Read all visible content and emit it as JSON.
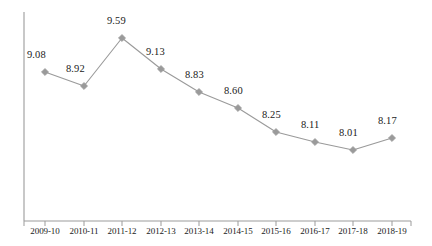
{
  "chart_data": {
    "type": "line",
    "title": "",
    "subtitle": "",
    "xlabel": "",
    "ylabel": "",
    "grid": false,
    "legend": "none",
    "axis_color": "#9b9b9b",
    "series_color": "#9a9a9a",
    "marker_color": "#9a9a9a",
    "marker_shape": "diamond",
    "label_color": "#1a1a1a",
    "ylim": [
      7.6,
      9.95
    ],
    "categories": [
      "2009-10",
      "2010-11",
      "2011-12",
      "2012-13",
      "2013-14",
      "2014-15",
      "2015-16",
      "2016-17",
      "2017-18",
      "2018-19"
    ],
    "values": [
      9.08,
      8.92,
      9.59,
      9.13,
      8.83,
      8.6,
      8.25,
      8.11,
      8.01,
      8.17
    ],
    "point_labels": [
      "9.08",
      "8.92",
      "9.59",
      "9.13",
      "8.83",
      "8.60",
      "8.25",
      "8.11",
      "8.01",
      "8.17"
    ],
    "points": [
      {
        "category": "2009-10",
        "value": 9.08,
        "label": "9.08",
        "px": 45,
        "py": 72,
        "lx": 27,
        "ly": 50
      },
      {
        "category": "2010-11",
        "value": 8.92,
        "label": "8.92",
        "px": 84,
        "py": 86,
        "lx": 66,
        "ly": 64
      },
      {
        "category": "2011-12",
        "value": 9.59,
        "label": "9.59",
        "px": 122,
        "py": 38,
        "lx": 107,
        "ly": 16
      },
      {
        "category": "2012-13",
        "value": 9.13,
        "label": "9.13",
        "px": 161,
        "py": 69,
        "lx": 146,
        "ly": 47
      },
      {
        "category": "2013-14",
        "value": 8.83,
        "label": "8.83",
        "px": 199,
        "py": 92,
        "lx": 185,
        "ly": 70
      },
      {
        "category": "2014-15",
        "value": 8.6,
        "label": "8.60",
        "px": 238,
        "py": 108,
        "lx": 224,
        "ly": 86
      },
      {
        "category": "2015-16",
        "value": 8.25,
        "label": "8.25",
        "px": 276,
        "py": 132,
        "lx": 262,
        "ly": 110
      },
      {
        "category": "2016-17",
        "value": 8.11,
        "label": "8.11",
        "px": 315,
        "py": 142,
        "lx": 301,
        "ly": 120
      },
      {
        "category": "2017-18",
        "value": 8.01,
        "label": "8.01",
        "px": 353,
        "py": 150,
        "lx": 339,
        "ly": 128
      },
      {
        "category": "2018-19",
        "value": 8.17,
        "label": "8.17",
        "px": 392,
        "py": 138,
        "lx": 378,
        "ly": 116
      }
    ],
    "axes": {
      "y_axis": {
        "x": 24,
        "y_top": 12,
        "y_bottom": 221
      },
      "x_axis": {
        "y": 221,
        "x_left": 24,
        "x_right": 411
      },
      "tick_length": 5
    },
    "tick_labels_y": 227
  }
}
